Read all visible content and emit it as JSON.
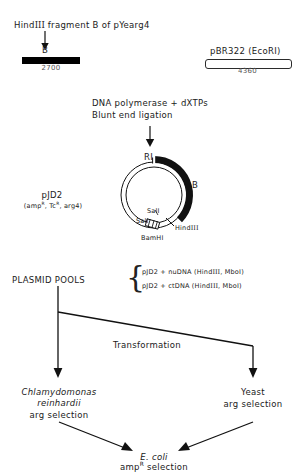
{
  "figure": {
    "domain": "molecular-cloning-flow-diagram",
    "background_color": "#ffffff",
    "ink_color": "#111111"
  },
  "step1": {
    "title_prefix": "Hind",
    "title_roman": "III",
    "title_suffix": " fragment B of pYearg4",
    "fragment_label": "B",
    "fragment_size": "2700",
    "vector_name": "pBR322 (EcoRI)",
    "vector_size": "4360"
  },
  "step2": {
    "line1": "DNA polymerase + dXTPs",
    "line2": "Blunt end ligation"
  },
  "plasmid": {
    "name": "pJD2",
    "markers_prefix": "(amp",
    "markers_sup1": "R",
    "markers_mid": ", Tc",
    "markers_sup2": "R",
    "markers_suffix": ", arg4)",
    "sites": {
      "ri": "RI",
      "insert": "B",
      "sal1": "SalI",
      "sal2": "SalI",
      "hind_prefix": "Hind",
      "hind_roman": "III",
      "bamhi": "BamHI"
    }
  },
  "pools": {
    "label": "PLASMID POOLS",
    "items": [
      {
        "plasmid": "pJD2 + nuDNA  (Hind",
        "roman": "III",
        "tail": ", MboI)"
      },
      {
        "plasmid": "pJD2 + ctDNA  (Hind",
        "roman": "III",
        "tail": ", MboI)"
      }
    ]
  },
  "transformation": {
    "label": "Transformation",
    "left_host_line1": "Chlamydomonas",
    "left_host_line2": "reinhardii",
    "left_selection": "arg selection",
    "right_host": "Yeast",
    "right_selection": "arg selection"
  },
  "final": {
    "host": "E. coli",
    "selection_prefix": "amp",
    "selection_sup": "R",
    "selection_suffix": " selection"
  }
}
